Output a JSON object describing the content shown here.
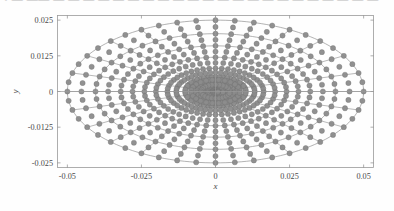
{
  "figure": {
    "background_color": "#fefefe",
    "axes_box": {
      "left": 57,
      "top": 15,
      "right": 374,
      "bottom": 168
    },
    "axis_color": "#9a9a9a",
    "mesh_line_color": "#8a8a8a",
    "node_color": "#8c8c8c",
    "node_edge_color": "#6f6f6f"
  },
  "top_text_fragment": "• — —— — —  — —  — — —  — — — —  — — — — —  — — — — — —",
  "axes": {
    "x_label": "x",
    "y_label": "y",
    "x_ticks": [
      "-0.05",
      "-0.025",
      "0",
      "0.025",
      "0.05"
    ],
    "x_tick_values": [
      -0.05,
      -0.025,
      0,
      0.025,
      0.05
    ],
    "y_ticks": [
      "0.025",
      "0.0125",
      "0",
      "-0.0125",
      "-0.025"
    ],
    "y_tick_values": [
      0.025,
      0.0125,
      0,
      -0.0125,
      -0.025
    ],
    "xlim": [
      -0.0535,
      0.0535
    ],
    "ylim": [
      -0.0268,
      0.0268
    ]
  },
  "chart_data": {
    "type": "scatter",
    "title": "",
    "xlabel": "x",
    "ylabel": "y",
    "xlim": [
      -0.0535,
      0.0535
    ],
    "ylim": [
      -0.0268,
      0.0268
    ],
    "grid": false,
    "legend": null,
    "geometry": {
      "semi_axis_x": 0.05,
      "semi_axis_y": 0.025,
      "aspect_ratio": 2.0,
      "ring_count": 9,
      "ring_fractions": [
        0.035,
        0.07,
        0.125,
        0.205,
        0.325,
        0.48,
        0.64,
        0.81,
        1.0
      ],
      "spoke_count": 24,
      "spoke_angles_deg": [
        0,
        15,
        30,
        45,
        60,
        75,
        90,
        105,
        120,
        135,
        150,
        165,
        180,
        195,
        210,
        225,
        240,
        255,
        270,
        285,
        300,
        315,
        330,
        345
      ],
      "element_type": "quadratic-serendipity",
      "node_marker": "filled-circle",
      "node_radius_px": 2.6,
      "node_count_approx": 432
    },
    "series": [
      {
        "name": "mesh nodes",
        "color": "#8c8c8c",
        "marker": "o",
        "values": "generated from geometry: ring_fractions x spoke_angles plus mid-edge midpoints"
      },
      {
        "name": "mesh lines",
        "color": "#8a8a8a",
        "linewidth": 0.6,
        "values": "ellipse rings and radial spokes"
      }
    ]
  }
}
